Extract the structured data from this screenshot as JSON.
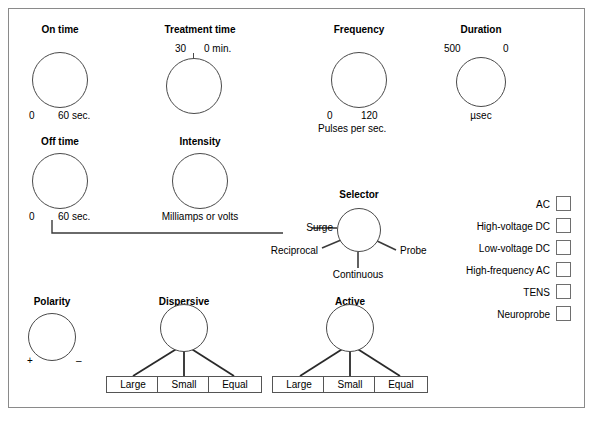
{
  "panel": {
    "title": "Electrotherapy control panel",
    "border_color": "#8a8a8a",
    "background": "#ffffff",
    "knob_color": "#4a4a4a"
  },
  "knobs": [
    {
      "id": "on-time",
      "label": "On time",
      "min_label": "0",
      "max_label": "60 sec.",
      "unit": ""
    },
    {
      "id": "treatment-time",
      "label": "Treatment time",
      "min_label": "30",
      "max_label": "0 min.",
      "unit": ""
    },
    {
      "id": "frequency",
      "label": "Frequency",
      "min_label": "0",
      "max_label": "120",
      "unit": "Pulses per sec."
    },
    {
      "id": "duration",
      "label": "Duration",
      "min_label": "500",
      "max_label": "0",
      "unit": "µsec"
    },
    {
      "id": "off-time",
      "label": "Off time",
      "min_label": "0",
      "max_label": "60 sec.",
      "unit": ""
    },
    {
      "id": "intensity",
      "label": "Intensity",
      "min_label": "",
      "max_label": "",
      "unit": "Milliamps or volts"
    },
    {
      "id": "polarity",
      "label": "Polarity",
      "min_label": "+",
      "max_label": "–",
      "unit": ""
    }
  ],
  "selector": {
    "label": "Selector",
    "options": [
      "Surge",
      "Reciprocal",
      "Continuous",
      "Probe"
    ]
  },
  "current_types": {
    "items": [
      "AC",
      "High-voltage DC",
      "Low-voltage DC",
      "High-frequency AC",
      "TENS",
      "Neuroprobe"
    ]
  },
  "electrodes": [
    {
      "id": "dispersive",
      "label": "Dispersive",
      "sizes": [
        "Large",
        "Small",
        "Equal"
      ]
    },
    {
      "id": "active",
      "label": "Active",
      "sizes": [
        "Large",
        "Small",
        "Equal"
      ]
    }
  ]
}
